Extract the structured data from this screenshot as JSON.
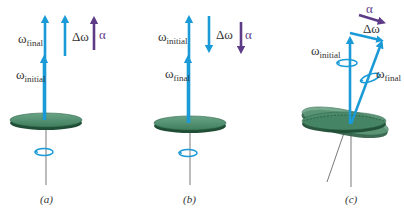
{
  "figure": {
    "panels": [
      {
        "id": "a",
        "caption": "(a)",
        "labels": {
          "omega_final": {
            "symbol": "ω",
            "sub": "final"
          },
          "omega_initial": {
            "symbol": "ω",
            "sub": "initial"
          },
          "delta_omega": "Δω",
          "alpha": "α"
        },
        "delta_direction": "up",
        "alpha_direction": "up"
      },
      {
        "id": "b",
        "caption": "(b)",
        "labels": {
          "omega_initial": {
            "symbol": "ω",
            "sub": "initial"
          },
          "omega_final": {
            "symbol": "ω",
            "sub": "final"
          },
          "delta_omega": "Δω",
          "alpha": "α"
        },
        "delta_direction": "down",
        "alpha_direction": "down"
      },
      {
        "id": "c",
        "caption": "(c)",
        "labels": {
          "alpha": "α",
          "delta_omega": "Δω",
          "omega_initial": {
            "symbol": "ω",
            "sub": "initial"
          },
          "omega_final": {
            "symbol": "ω",
            "sub": "final"
          }
        },
        "delta_direction": "right",
        "alpha_direction": "right"
      }
    ],
    "colors": {
      "omega_arrow": "#1a9ad6",
      "alpha_arrow": "#5e3b87",
      "disk_top": "#4f8f6e",
      "disk_edge": "#1f4d35",
      "axis": "#555555",
      "text": "#333333"
    }
  }
}
